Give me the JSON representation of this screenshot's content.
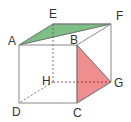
{
  "diagram": {
    "type": "cube",
    "vertices": {
      "A": {
        "label": "A",
        "x": 19,
        "y": 45
      },
      "B": {
        "label": "B",
        "x": 77,
        "y": 45
      },
      "C": {
        "label": "C",
        "x": 77,
        "y": 103
      },
      "D": {
        "label": "D",
        "x": 19,
        "y": 103
      },
      "E": {
        "label": "E",
        "x": 53,
        "y": 24
      },
      "F": {
        "label": "F",
        "x": 111,
        "y": 24
      },
      "G": {
        "label": "G",
        "x": 111,
        "y": 82
      },
      "H": {
        "label": "H",
        "x": 53,
        "y": 82
      }
    },
    "shaded_regions": [
      {
        "name": "triangle-AEF",
        "vertices": [
          "A",
          "E",
          "F"
        ],
        "color": "#7dbf85"
      },
      {
        "name": "triangle-BCG",
        "vertices": [
          "B",
          "C",
          "G"
        ],
        "color": "#ef8e8e"
      }
    ],
    "hidden_edges": [
      "EH",
      "HD",
      "HG"
    ],
    "edge_color": "#888888",
    "hidden_edge_color": "#555555"
  }
}
